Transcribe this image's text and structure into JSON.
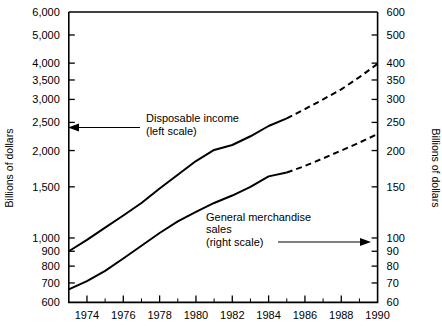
{
  "chart_data": {
    "type": "line",
    "title": "",
    "xlabel": "",
    "ylabel": "Billions of dollars",
    "y2label": "Billions of dollars",
    "grid": false,
    "yscale": "log",
    "y2scale": "log",
    "xlim": [
      1973,
      1990
    ],
    "ylim": [
      600,
      6000
    ],
    "y2lim": [
      60,
      600
    ],
    "ytick_labels": [
      "600",
      "700",
      "800",
      "900",
      "1,000",
      "1,500",
      "2,000",
      "2,500",
      "3,000",
      "3,500",
      "4,000",
      "5,000",
      "6,000"
    ],
    "ytick_values": [
      600,
      700,
      800,
      900,
      1000,
      1500,
      2000,
      2500,
      3000,
      3500,
      4000,
      5000,
      6000
    ],
    "y2tick_labels": [
      "60",
      "70",
      "80",
      "90",
      "100",
      "150",
      "200",
      "250",
      "300",
      "350",
      "400",
      "500",
      "600"
    ],
    "y2tick_values": [
      60,
      70,
      80,
      90,
      100,
      150,
      200,
      250,
      300,
      350,
      400,
      500,
      600
    ],
    "xtick_labels": [
      "1974",
      "1976",
      "1978",
      "1980",
      "1982",
      "1984",
      "1986",
      "1988",
      "1990"
    ],
    "xtick_values": [
      1974,
      1976,
      1978,
      1980,
      1982,
      1984,
      1986,
      1988,
      1990
    ],
    "xminor_values": [
      1975,
      1977,
      1979,
      1981,
      1983,
      1985,
      1987,
      1989
    ],
    "series": [
      {
        "name": "Disposable income",
        "scale": "left",
        "style": "solid-then-dashed",
        "solid_until": 1985,
        "x": [
          1973,
          1974,
          1975,
          1976,
          1977,
          1978,
          1979,
          1980,
          1981,
          1982,
          1983,
          1984,
          1985,
          1986,
          1987,
          1988,
          1989,
          1990
        ],
        "values": [
          900,
          985,
          1085,
          1195,
          1320,
          1480,
          1650,
          1840,
          2010,
          2090,
          2240,
          2430,
          2580,
          2780,
          3000,
          3250,
          3580,
          3980
        ]
      },
      {
        "name": "General merchandise sales",
        "scale": "right",
        "style": "solid-then-dashed",
        "solid_until": 1985,
        "x": [
          1973,
          1974,
          1975,
          1976,
          1977,
          1978,
          1979,
          1980,
          1981,
          1982,
          1983,
          1984,
          1985,
          1986,
          1987,
          1988,
          1989,
          1990
        ],
        "values": [
          66.5,
          71,
          77,
          85,
          94,
          104,
          114,
          123,
          132,
          140,
          150,
          163,
          168,
          177,
          188,
          200,
          213,
          228
        ]
      }
    ],
    "annotations": [
      {
        "id": "disposable-income",
        "lines": [
          "Disposable income",
          "(left scale)"
        ],
        "arrow_direction": "left"
      },
      {
        "id": "general-merchandise-sales",
        "lines": [
          "General merchandise",
          "sales",
          "(right scale)"
        ],
        "arrow_direction": "right"
      }
    ]
  }
}
